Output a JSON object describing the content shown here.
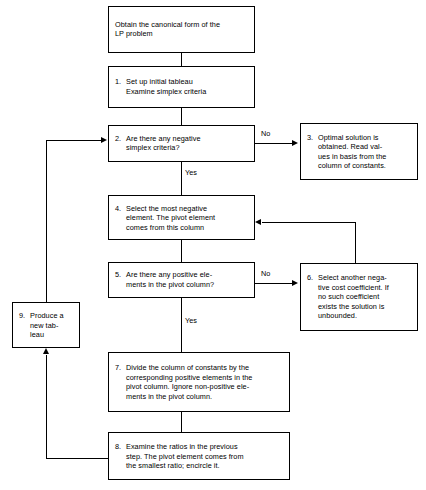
{
  "diagram": {
    "type": "flowchart"
  },
  "nodes": {
    "start": {
      "number": "",
      "line1": "Obtain the canonical form of the",
      "line2": "LP problem"
    },
    "n1": {
      "number": "1.",
      "line1": "Set up initial tableau",
      "line2": "Examine simplex criteria"
    },
    "n2": {
      "number": "2.",
      "line1": "Are there any negative",
      "line2": "simplex criteria?"
    },
    "n3": {
      "number": "3.",
      "line1": "Optimal solution is",
      "line2": "obtained. Read val-",
      "line3": "ues in basis from the",
      "line4": "column of constants."
    },
    "n4": {
      "number": "4.",
      "line1": "Select the most negative",
      "line2": "element. The pivot element",
      "line3": "comes from this column"
    },
    "n5": {
      "number": "5.",
      "line1": "Are there any positive ele-",
      "line2": "ments in the pivot column?"
    },
    "n6": {
      "number": "6.",
      "line1": "Select another nega-",
      "line2": "tive cost coefficient. If",
      "line3": "no such coefficient",
      "line4": "exists the solution is",
      "line5": "unbounded."
    },
    "n7": {
      "number": "7.",
      "line1": "Divide the column of constants by the",
      "line2": "corresponding positive elements in the",
      "line3": "pivot column. Ignore non-positive ele-",
      "line4": "ments in the pivot column."
    },
    "n8": {
      "number": "8.",
      "line1": "Examine the ratios in the previous",
      "line2": "step. The pivot element comes from",
      "line3": "the smallest ratio; encircle it."
    },
    "n9": {
      "number": "9.",
      "line1": "Produce a",
      "line2": "new tab-",
      "line3": "leau"
    }
  },
  "edge_labels": {
    "no_from_2": "No",
    "yes_from_2": "Yes",
    "no_from_5": "No",
    "yes_from_5": "Yes"
  },
  "colors": {
    "stroke": "#000000",
    "fill": "#ffffff",
    "text": "#000000"
  }
}
